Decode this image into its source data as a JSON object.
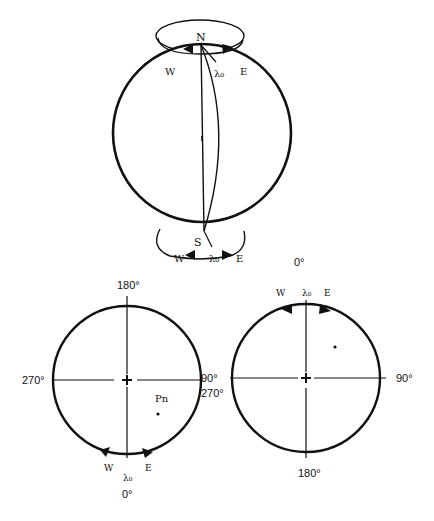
{
  "figure": {
    "top_globe": {
      "north_label": "N",
      "south_label": "S",
      "north_ring": {
        "west_label": "W",
        "east_label": "E",
        "lambda_label": "λ₀"
      },
      "south_ring": {
        "west_label": "W",
        "east_label": "E",
        "lambda_label": "λ₀"
      }
    },
    "left_polar_view": {
      "top_label": "180°",
      "left_label": "270°",
      "right_label": "90°",
      "bottom_label": "0°",
      "lambda_label": "λ₀",
      "west_label": "W",
      "east_label": "E",
      "point_label": "Pn"
    },
    "right_polar_view": {
      "top_label": "0°",
      "left_label": "270°",
      "right_label": "90°",
      "bottom_label": "180°",
      "lambda_label": "λ₀",
      "west_label": "W",
      "east_label": "E"
    }
  },
  "colors": {
    "ink": "#111111",
    "background": "#ffffff"
  }
}
